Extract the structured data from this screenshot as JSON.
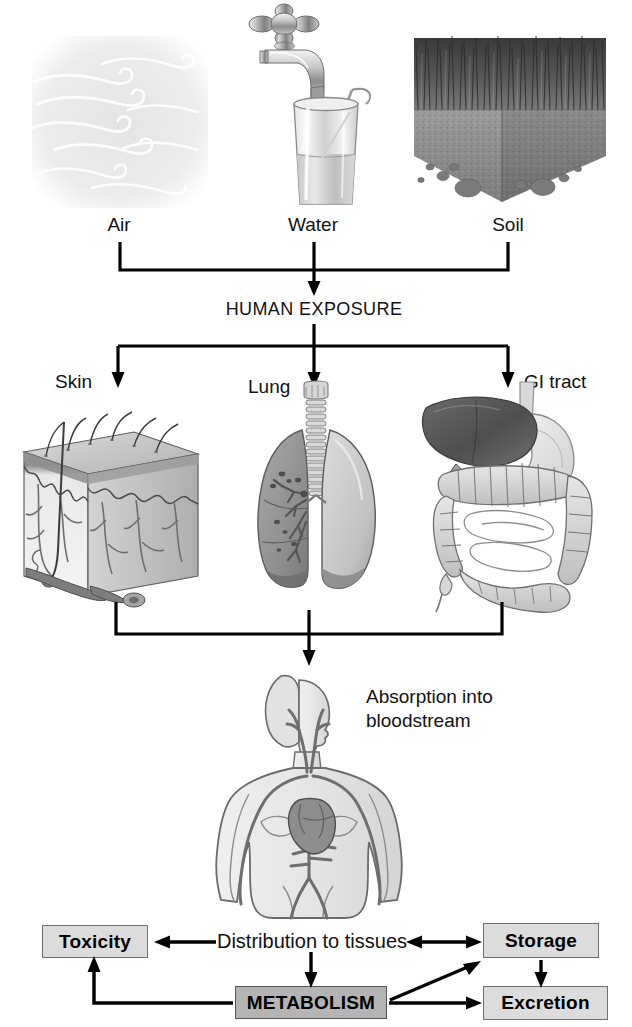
{
  "diagram": {
    "sources": [
      {
        "id": "air",
        "label": "Air",
        "icon": "wind-swirls-icon"
      },
      {
        "id": "water",
        "label": "Water",
        "icon": "faucet-glass-icon"
      },
      {
        "id": "soil",
        "label": "Soil",
        "icon": "soil-block-icon"
      }
    ],
    "exposure_label": "HUMAN EXPOSURE",
    "routes": [
      {
        "id": "skin",
        "label": "Skin",
        "icon": "skin-cross-section-icon"
      },
      {
        "id": "lung",
        "label": "Lung",
        "icon": "lungs-icon"
      },
      {
        "id": "gi_tract",
        "label": "GI tract",
        "icon": "gi-tract-icon"
      }
    ],
    "absorption": {
      "line1": "Absorption into",
      "line2": "bloodstream",
      "icon": "human-body-circulatory-icon"
    },
    "distribution_label": "Distribution to tissues",
    "boxes": [
      {
        "id": "toxicity",
        "label": "Toxicity",
        "fill": "#dcdcdc"
      },
      {
        "id": "storage",
        "label": "Storage",
        "fill": "#dcdcdc"
      },
      {
        "id": "metabolism",
        "label": "METABOLISM",
        "fill": "#b4b4b4"
      },
      {
        "id": "excretion",
        "label": "Excretion",
        "fill": "#dcdcdc"
      }
    ],
    "colors": {
      "line": "#000000",
      "box_light": "#dcdcdc",
      "box_dark": "#b4b4b4",
      "box_border": "#6f6f6f",
      "text": "#111111",
      "air_panel": "#e9e9e9",
      "organ_mid": "#9a9a9a",
      "organ_light": "#d6d6d6",
      "organ_dark": "#6b6b6b"
    }
  }
}
